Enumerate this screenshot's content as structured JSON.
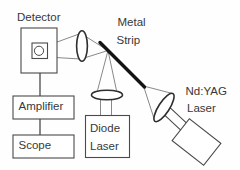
{
  "diagram": {
    "description_labels_only": "laser ultrasonics optical setup schematic",
    "detector": {
      "label": "Detector"
    },
    "amplifier": {
      "label": "Amplifier"
    },
    "scope": {
      "label": "Scope"
    },
    "metal_strip": {
      "label_lines": [
        "Metal",
        "Strip"
      ]
    },
    "diode_laser": {
      "label_lines": [
        "Diode",
        "Laser"
      ]
    },
    "nd_yag_laser": {
      "label_lines": [
        "Nd:YAG",
        "Laser"
      ]
    },
    "colors": {
      "background": "#fefefe",
      "box_stroke": "#4a4a4a",
      "lens_stroke": "#2e2e2e",
      "beam_stroke": "#6a6a6a",
      "strip_stroke": "#141414",
      "text": "#383838"
    }
  }
}
